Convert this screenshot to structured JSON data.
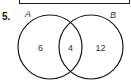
{
  "problem": {
    "number": "5."
  },
  "venn": {
    "sets": [
      {
        "label": "A",
        "cx": 50,
        "cy": 47,
        "r": 32
      },
      {
        "label": "B",
        "cx": 91,
        "cy": 47,
        "r": 32
      }
    ],
    "regions": {
      "a_only": "6",
      "a_and_b": "4",
      "b_only": "12"
    },
    "stroke_color": "#1a1a1a"
  }
}
